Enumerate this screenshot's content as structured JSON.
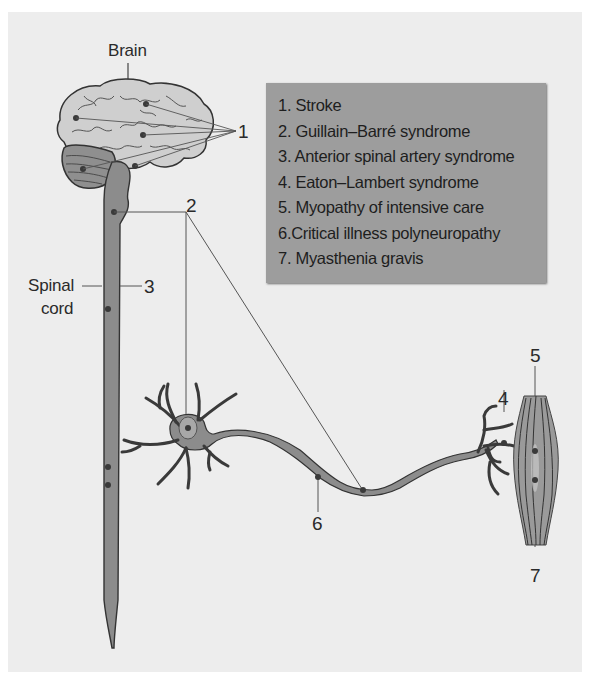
{
  "figure": {
    "labels": {
      "brain": "Brain",
      "spinal_cord_line1": "Spinal",
      "spinal_cord_line2": "cord",
      "marker_1": "1",
      "marker_2": "2",
      "marker_3": "3",
      "marker_4": "4",
      "marker_5": "5",
      "marker_6": "6",
      "marker_7": "7"
    },
    "legend": {
      "items": [
        "1. Stroke",
        "2. Guillain–Barré syndrome",
        "3. Anterior spinal artery syndrome",
        "4. Eaton–Lambert syndrome",
        "5. Myopathy of intensive care",
        "6.Critical illness polyneuropathy",
        "7. Myasthenia gravis"
      ]
    },
    "colors": {
      "panel_background": "#ededed",
      "legend_background": "#9d9d9d",
      "brain_fill": "#c9c9c9",
      "cord_fill": "#8c8c8c",
      "outline": "#3a3a3a"
    }
  }
}
